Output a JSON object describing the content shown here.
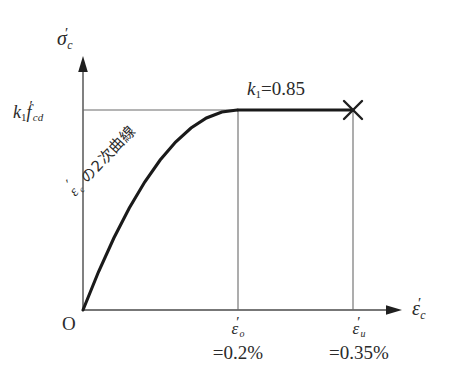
{
  "chart_data": {
    "type": "line",
    "title": "",
    "xlabel": "ε'c",
    "ylabel": "σ'c",
    "xlim": [
      0,
      0.4
    ],
    "ylim": [
      0,
      1.15
    ],
    "grid": false,
    "legend": "none",
    "x": [
      0.0,
      0.02,
      0.04,
      0.06,
      0.08,
      0.1,
      0.12,
      0.14,
      0.16,
      0.18,
      0.2,
      0.25,
      0.3,
      0.35
    ],
    "y": [
      0.0,
      0.19,
      0.36,
      0.51,
      0.64,
      0.75,
      0.84,
      0.91,
      0.96,
      0.99,
      1.0,
      1.0,
      1.0,
      1.0
    ],
    "x_ticks": [
      {
        "value": 0.0,
        "label": "O"
      },
      {
        "value": 0.2,
        "label": "ε'o",
        "sublabel": "=0.2%"
      },
      {
        "value": 0.35,
        "label": "ε'u",
        "sublabel": "=0.35%"
      }
    ],
    "y_ticks": [
      {
        "value": 1.0,
        "label": "k1f'cd"
      }
    ],
    "annotations": [
      {
        "text": "k1=0.85",
        "x": 0.27,
        "y": 1.06
      },
      {
        "text": "ε'c の2次曲線",
        "x": 0.06,
        "y": 0.55,
        "rotation": -47
      }
    ],
    "markers": [
      {
        "type": "x-cross",
        "x": 0.35,
        "y": 1.0
      }
    ]
  },
  "axes": {
    "y_axis": {
      "name": "sigma-prime-c",
      "symbol": "σ",
      "prime": "′",
      "subscript": "c"
    },
    "x_axis": {
      "name": "epsilon-prime-c",
      "symbol": "ε",
      "prime": "′",
      "subscript": "c"
    },
    "origin_label": "O"
  },
  "y_tick": {
    "k": "k",
    "k_sub": "1",
    "f": "f",
    "prime": "′",
    "f_sub": "cd",
    "full_text": "k1f'cd"
  },
  "k1_annotation": {
    "k": "k",
    "sub": "1",
    "equals": "=",
    "value": "0.85",
    "full_text": "k1=0.85"
  },
  "x_ticks": {
    "eo": {
      "symbol": "ε",
      "prime": "′",
      "sub": "o",
      "value": "=0.2%"
    },
    "eu": {
      "symbol": "ε",
      "prime": "′",
      "sub": "u",
      "value": "=0.35%"
    }
  },
  "curve_annotation": {
    "symbol": "ε",
    "prime": "′",
    "sub": "c",
    "text": " の2次曲線",
    "full_text": "ε'c の2次曲線"
  },
  "colors": {
    "background": "#ffffff",
    "curve": "#1a1a1a",
    "axis": "#4a4a4a",
    "guide_line": "#555555",
    "text": "#2b2b2b"
  }
}
